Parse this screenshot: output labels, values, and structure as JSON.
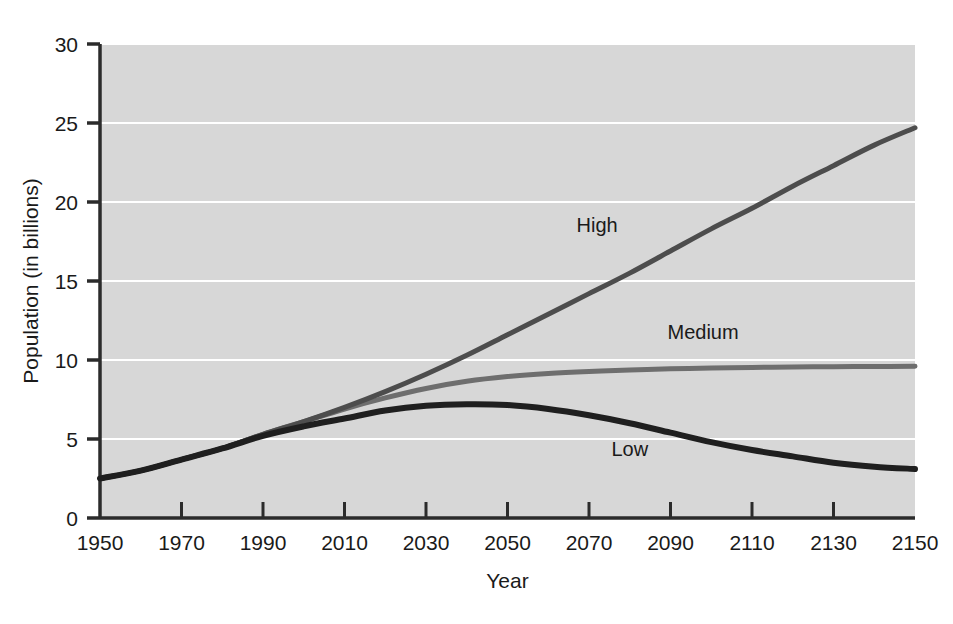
{
  "chart_data": {
    "type": "line",
    "title": "",
    "xlabel": "Year",
    "ylabel": "Population (in billions)",
    "xlim": [
      1950,
      2150
    ],
    "ylim": [
      0,
      30
    ],
    "grid": true,
    "grid_color": "#ffffff",
    "plot_background": "#d7d7d7",
    "legend_position": "inline-annotations",
    "x_tick_labels": [
      "1950",
      "1970",
      "1990",
      "2010",
      "2030",
      "2050",
      "2070",
      "2090",
      "2110",
      "2130",
      "2150"
    ],
    "x_ticks": [
      1950,
      1970,
      1990,
      2010,
      2030,
      2050,
      2070,
      2090,
      2110,
      2130,
      2150
    ],
    "y_tick_labels": [
      "0",
      "5",
      "10",
      "15",
      "20",
      "25",
      "30"
    ],
    "y_ticks": [
      0,
      5,
      10,
      15,
      20,
      25,
      30
    ],
    "x": [
      1950,
      1960,
      1970,
      1980,
      1990,
      2000,
      2010,
      2020,
      2030,
      2040,
      2050,
      2060,
      2070,
      2080,
      2090,
      2100,
      2110,
      2120,
      2130,
      2140,
      2150
    ],
    "series": [
      {
        "name": "High",
        "color": "#4d4d4d",
        "width": 5,
        "values": [
          2.5,
          3.0,
          3.7,
          4.4,
          5.3,
          6.1,
          7.0,
          8.0,
          9.1,
          10.3,
          11.6,
          12.9,
          14.2,
          15.5,
          16.9,
          18.3,
          19.6,
          21.0,
          22.3,
          23.6,
          24.7
        ]
      },
      {
        "name": "Medium",
        "color": "#6e6e6e",
        "width": 5,
        "values": [
          2.5,
          3.0,
          3.7,
          4.4,
          5.3,
          6.1,
          6.9,
          7.6,
          8.2,
          8.65,
          8.95,
          9.15,
          9.28,
          9.37,
          9.44,
          9.49,
          9.53,
          9.56,
          9.58,
          9.59,
          9.6
        ]
      },
      {
        "name": "Low",
        "color": "#1f1f1f",
        "width": 6,
        "values": [
          2.5,
          3.0,
          3.7,
          4.4,
          5.2,
          5.8,
          6.3,
          6.8,
          7.1,
          7.2,
          7.15,
          6.9,
          6.5,
          6.0,
          5.4,
          4.8,
          4.3,
          3.9,
          3.5,
          3.25,
          3.1
        ]
      }
    ],
    "annotations": [
      {
        "text": "High",
        "x": 2072,
        "y": 18.1
      },
      {
        "text": "Medium",
        "x": 2098,
        "y": 11.3
      },
      {
        "text": "Low",
        "x": 2080,
        "y": 3.9
      }
    ]
  }
}
